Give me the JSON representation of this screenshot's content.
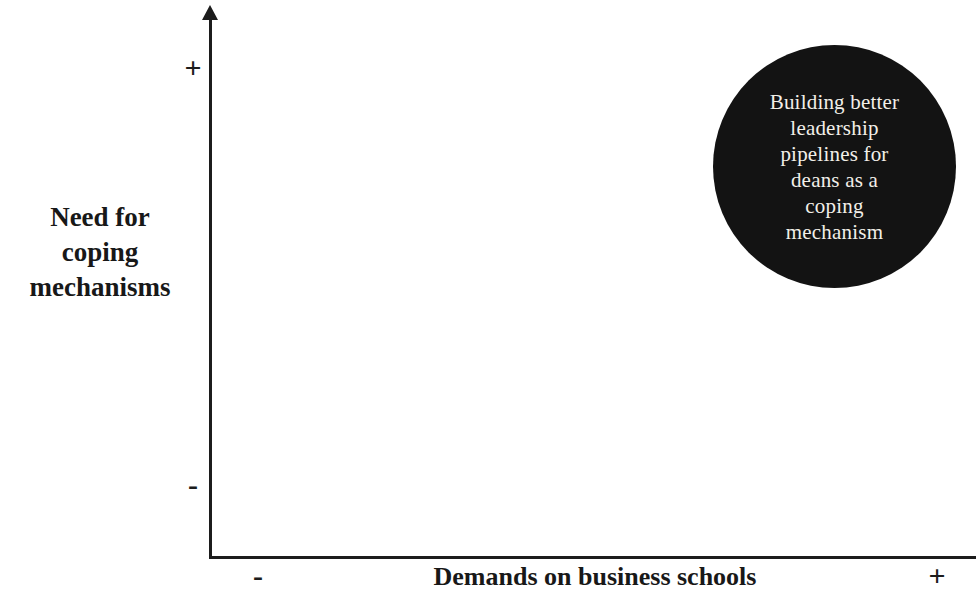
{
  "chart_data": {
    "type": "scatter",
    "title": "",
    "xlabel": "Demands on business schools",
    "ylabel": "Need for coping mechanisms",
    "xlim": [
      "-",
      "+"
    ],
    "ylim": [
      "-",
      "+"
    ],
    "grid": false,
    "legend": "none",
    "x_axis_min_label": "-",
    "x_axis_max_label": "+",
    "y_axis_min_label": "-",
    "y_axis_max_label": "+",
    "points": [
      {
        "label": "Building better leadership pipelines for deans as a coping mechanism",
        "x": "high",
        "y": "high",
        "x_value": 0.85,
        "y_value": 0.82,
        "marker": "filled-circle",
        "size": 243,
        "color": "#131313",
        "text_color": "#f2efe9",
        "label_lines": [
          "Building better",
          "leadership",
          "pipelines for",
          "deans as a",
          "coping",
          "mechanism"
        ]
      }
    ]
  },
  "axes": {
    "y": {
      "title_lines": [
        "Need for",
        "coping",
        "mechanisms"
      ],
      "plus": "+",
      "minus": "-"
    },
    "x": {
      "title": "Demands on business schools",
      "plus": "+",
      "minus": "-"
    }
  },
  "colors": {
    "axis": "#1c1c1c",
    "bubble_fill": "#131313",
    "bubble_text": "#f2efe9",
    "background": "#ffffff"
  }
}
